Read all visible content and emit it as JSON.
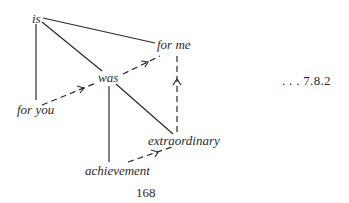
{
  "diagram": {
    "nodes": {
      "is": "is",
      "for_me": "for me",
      "was": "was",
      "for_you": "for you",
      "extraordinary": "extraordinary",
      "achievement": "achievement"
    },
    "solid_edges": [
      {
        "from": "is",
        "to": "for me"
      },
      {
        "from": "is",
        "to": "was"
      },
      {
        "from": "is",
        "to": "for you"
      },
      {
        "from": "was",
        "to": "achievement"
      },
      {
        "from": "was",
        "to": "extraordinary"
      }
    ],
    "dashed_arrows": [
      {
        "from": "for you",
        "to": "was"
      },
      {
        "from": "was",
        "to": "for me"
      },
      {
        "from": "achievement",
        "to": "extraordinary"
      },
      {
        "from": "extraordinary",
        "to": "for me"
      }
    ],
    "reference_label": ". . . 7.8.2",
    "page_number": "168"
  }
}
